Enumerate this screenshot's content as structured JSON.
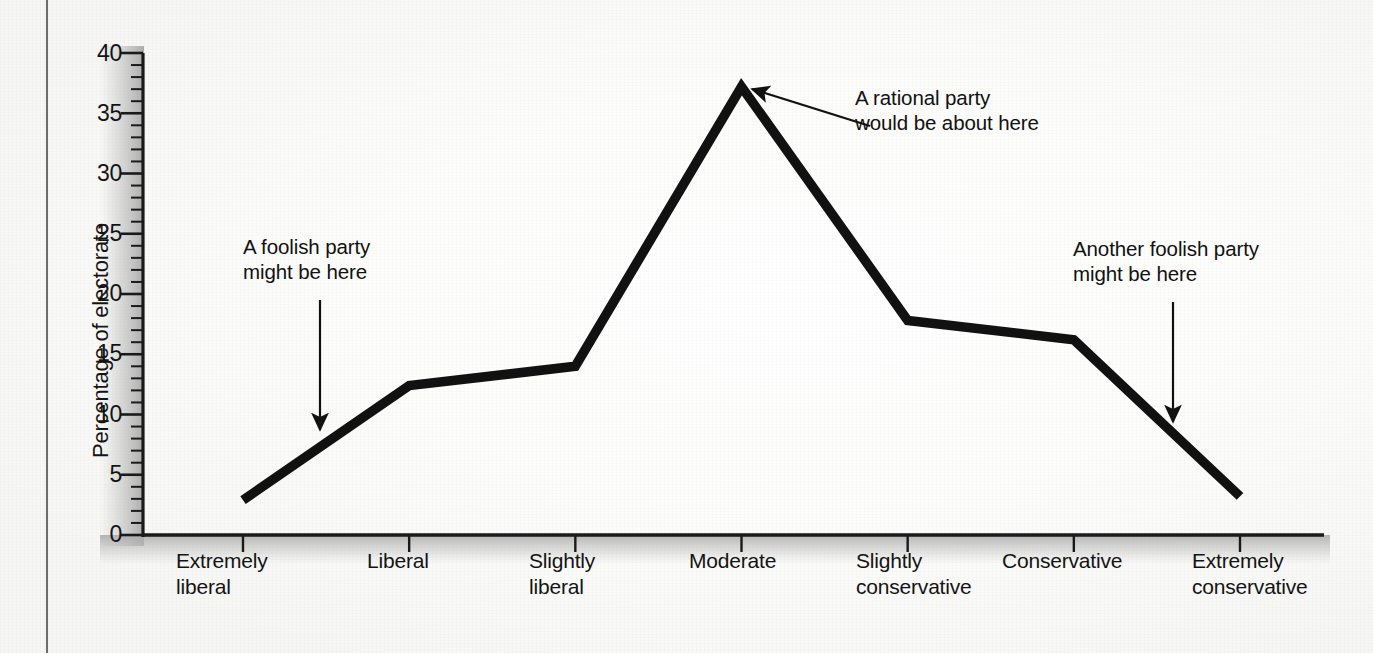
{
  "chart_data": {
    "type": "line",
    "title": "",
    "xlabel": "",
    "ylabel": "Percentage of electorate",
    "ylim": [
      0,
      40
    ],
    "ytick_step": 5,
    "yminor_step": 1,
    "grid": false,
    "legend": "none",
    "categories": [
      "Extremely\nliberal",
      "Liberal",
      "Slightly\nliberal",
      "Moderate",
      "Slightly\nconservative",
      "Conservative",
      "Extremely\nconservative"
    ],
    "values": [
      2.9,
      12.4,
      14.0,
      37.2,
      17.8,
      16.2,
      3.2
    ],
    "ytick_labels": [
      "0",
      "5",
      "10",
      "15",
      "20",
      "25",
      "30",
      "35",
      "40"
    ],
    "series": [
      {
        "name": "Distribution of electorate",
        "values": [
          2.9,
          12.4,
          14.0,
          37.2,
          17.8,
          16.2,
          3.2
        ]
      }
    ],
    "annotations": [
      {
        "id": "foolish-left",
        "text": "A foolish party\nmight be here",
        "points_to_category": "Extremely liberal / Liberal midpoint",
        "arrow": "down"
      },
      {
        "id": "rational-center",
        "text": "A rational party\nwould be about here",
        "points_to_category": "Moderate",
        "arrow": "diagonal-left"
      },
      {
        "id": "foolish-right",
        "text": "Another foolish party\nmight be here",
        "points_to_category": "Conservative / Extremely conservative midpoint",
        "arrow": "down"
      }
    ],
    "line_color": "#111111",
    "axis_color": "#1a1a1a"
  }
}
